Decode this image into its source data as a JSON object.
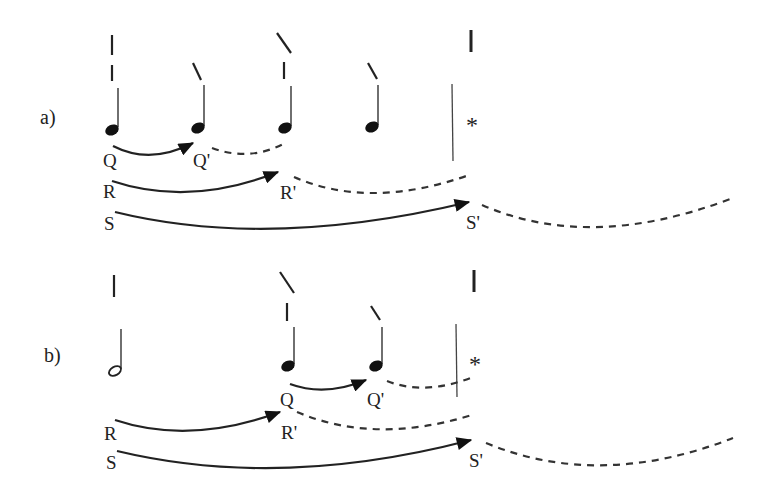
{
  "diagram": {
    "type": "music-rhythm-expectation-diagram",
    "colors": {
      "ink": "#222222",
      "background": "#ffffff"
    },
    "panels": [
      {
        "id": "a",
        "label": "a)",
        "notes": [
          {
            "kind": "quarter",
            "accent": [
              "strong",
              "weak"
            ]
          },
          {
            "kind": "quarter",
            "accent": [
              "slash"
            ]
          },
          {
            "kind": "quarter",
            "accent": [
              "slash-strong",
              "weak"
            ]
          },
          {
            "kind": "quarter",
            "accent": [
              "slash"
            ]
          }
        ],
        "barline_marker": "|",
        "star": "*",
        "arcs": [
          {
            "from": "Q",
            "to": "Q'",
            "style": "solid-arrow"
          },
          {
            "from": "R",
            "to": "R'",
            "style": "solid-arrow"
          },
          {
            "from": "S",
            "to": "S'",
            "style": "solid-arrow"
          }
        ],
        "labels": {
          "Q": "Q",
          "Qp": "Q'",
          "R": "R",
          "Rp": "R'",
          "S": "S",
          "Sp": "S'"
        }
      },
      {
        "id": "b",
        "label": "b)",
        "notes": [
          {
            "kind": "half",
            "accent": [
              "strong"
            ]
          },
          {
            "kind": "quarter",
            "accent": [
              "slash-strong",
              "weak"
            ]
          },
          {
            "kind": "quarter",
            "accent": [
              "slash"
            ]
          }
        ],
        "barline_marker": "|",
        "star": "*",
        "arcs": [
          {
            "from": "Q",
            "to": "Q'",
            "style": "solid-arrow"
          },
          {
            "from": "R",
            "to": "R'",
            "style": "solid-arrow"
          },
          {
            "from": "S",
            "to": "S'",
            "style": "solid-arrow"
          }
        ],
        "labels": {
          "Q": "Q",
          "Qp": "Q'",
          "R": "R",
          "Rp": "R'",
          "S": "S",
          "Sp": "S'"
        }
      }
    ]
  }
}
